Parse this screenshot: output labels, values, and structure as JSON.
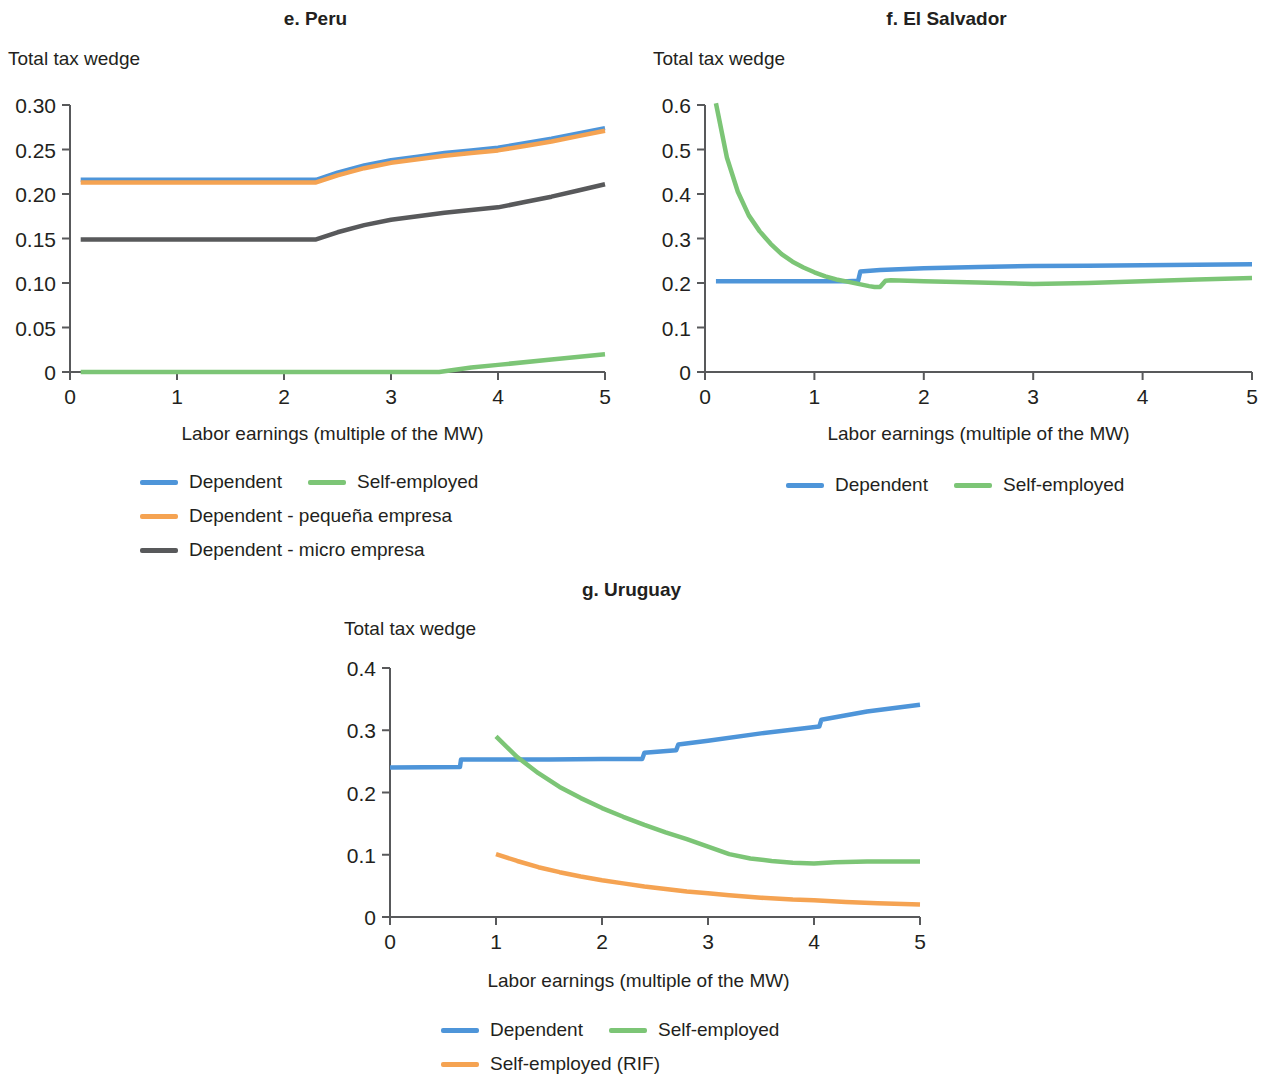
{
  "colors": {
    "dependent": "#4e95d9",
    "self_employed": "#7cc576",
    "dependent_pequena": "#f5a352",
    "dependent_micro": "#58595b",
    "self_employed_rif": "#f5a352",
    "axis": "#58595b",
    "text": "#231f20"
  },
  "panels": {
    "peru": {
      "title": "e. Peru",
      "y_axis_title": "Total tax wedge",
      "x_axis_title": "Labor earnings (multiple of the MW)",
      "legend": [
        [
          {
            "label": "Dependent",
            "color": "#4e95d9"
          },
          {
            "label": "Self-employed",
            "color": "#7cc576"
          }
        ],
        [
          {
            "label": "Dependent - pequeña empresa",
            "color": "#f5a352"
          }
        ],
        [
          {
            "label": "Dependent - micro empresa",
            "color": "#58595b"
          }
        ]
      ]
    },
    "el_salvador": {
      "title": "f. El Salvador",
      "y_axis_title": "Total tax wedge",
      "x_axis_title": "Labor earnings (multiple of the MW)",
      "legend": [
        [
          {
            "label": "Dependent",
            "color": "#4e95d9"
          },
          {
            "label": "Self-employed",
            "color": "#7cc576"
          }
        ]
      ]
    },
    "uruguay": {
      "title": "g. Uruguay",
      "y_axis_title": "Total tax wedge",
      "x_axis_title": "Labor earnings (multiple of the MW)",
      "legend": [
        [
          {
            "label": "Dependent",
            "color": "#4e95d9"
          },
          {
            "label": "Self-employed",
            "color": "#7cc576"
          }
        ],
        [
          {
            "label": "Self-employed (RIF)",
            "color": "#f5a352"
          }
        ]
      ]
    }
  },
  "chart_data": [
    {
      "id": "peru",
      "type": "line",
      "title": "e. Peru",
      "xlabel": "Labor earnings (multiple of the MW)",
      "ylabel": "Total tax wedge",
      "xlim": [
        0,
        5
      ],
      "ylim": [
        0,
        0.3
      ],
      "xticks": [
        "0",
        "1",
        "2",
        "3",
        "4",
        "5"
      ],
      "yticks": [
        "0",
        "0.05",
        "0.10",
        "0.15",
        "0.20",
        "0.25",
        "0.30"
      ],
      "grid": false,
      "legend_position": "below",
      "series": [
        {
          "name": "Dependent",
          "color": "#4e95d9",
          "x": [
            0.1,
            0.5,
            1.0,
            1.5,
            2.0,
            2.3,
            2.5,
            2.75,
            3.0,
            3.25,
            3.5,
            3.75,
            4.0,
            4.25,
            4.5,
            4.75,
            5.0
          ],
          "y": [
            0.216,
            0.216,
            0.216,
            0.216,
            0.216,
            0.216,
            0.224,
            0.232,
            0.238,
            0.242,
            0.246,
            0.249,
            0.252,
            0.257,
            0.262,
            0.268,
            0.274
          ]
        },
        {
          "name": "Dependent - pequeña empresa",
          "color": "#f5a352",
          "x": [
            0.1,
            0.5,
            1.0,
            1.5,
            2.0,
            2.3,
            2.5,
            2.75,
            3.0,
            3.25,
            3.5,
            3.75,
            4.0,
            4.25,
            4.5,
            4.75,
            5.0
          ],
          "y": [
            0.213,
            0.213,
            0.213,
            0.213,
            0.213,
            0.213,
            0.221,
            0.229,
            0.235,
            0.239,
            0.243,
            0.246,
            0.249,
            0.254,
            0.259,
            0.265,
            0.271
          ]
        },
        {
          "name": "Dependent - micro empresa",
          "color": "#58595b",
          "x": [
            0.1,
            0.5,
            1.0,
            1.5,
            2.0,
            2.3,
            2.5,
            2.75,
            3.0,
            3.25,
            3.5,
            3.75,
            4.0,
            4.25,
            4.5,
            4.75,
            5.0
          ],
          "y": [
            0.149,
            0.149,
            0.149,
            0.149,
            0.149,
            0.149,
            0.157,
            0.165,
            0.171,
            0.175,
            0.179,
            0.182,
            0.185,
            0.191,
            0.197,
            0.204,
            0.211
          ]
        },
        {
          "name": "Self-employed",
          "color": "#7cc576",
          "x": [
            0.1,
            1.0,
            2.0,
            3.0,
            3.45,
            3.75,
            4.0,
            4.5,
            5.0
          ],
          "y": [
            0.0,
            0.0,
            0.0,
            0.0,
            0.0,
            0.005,
            0.008,
            0.014,
            0.02
          ]
        }
      ]
    },
    {
      "id": "el_salvador",
      "type": "line",
      "title": "f. El Salvador",
      "xlabel": "Labor earnings (multiple of the MW)",
      "ylabel": "Total tax wedge",
      "xlim": [
        0,
        5
      ],
      "ylim": [
        0,
        0.6
      ],
      "xticks": [
        "0",
        "1",
        "2",
        "3",
        "4",
        "5"
      ],
      "yticks": [
        "0",
        "0.1",
        "0.2",
        "0.3",
        "0.4",
        "0.5",
        "0.6"
      ],
      "grid": false,
      "legend_position": "below",
      "series": [
        {
          "name": "Dependent",
          "color": "#4e95d9",
          "x": [
            0.1,
            0.5,
            1.0,
            1.3,
            1.4,
            1.42,
            1.6,
            2.0,
            2.5,
            3.0,
            3.5,
            4.0,
            4.5,
            5.0
          ],
          "y": [
            0.204,
            0.204,
            0.204,
            0.204,
            0.205,
            0.226,
            0.229,
            0.233,
            0.236,
            0.238,
            0.239,
            0.24,
            0.241,
            0.242
          ]
        },
        {
          "name": "Self-employed",
          "color": "#7cc576",
          "x": [
            0.1,
            0.2,
            0.3,
            0.4,
            0.5,
            0.6,
            0.7,
            0.8,
            0.9,
            1.0,
            1.1,
            1.2,
            1.3,
            1.4,
            1.5,
            1.55,
            1.6,
            1.65,
            1.7,
            2.0,
            2.5,
            3.0,
            3.5,
            4.0,
            4.5,
            5.0
          ],
          "y": [
            0.604,
            0.482,
            0.405,
            0.352,
            0.316,
            0.288,
            0.265,
            0.248,
            0.235,
            0.224,
            0.215,
            0.208,
            0.203,
            0.198,
            0.193,
            0.191,
            0.191,
            0.205,
            0.206,
            0.204,
            0.201,
            0.198,
            0.2,
            0.204,
            0.208,
            0.211
          ]
        }
      ]
    },
    {
      "id": "uruguay",
      "type": "line",
      "title": "g. Uruguay",
      "xlabel": "Labor earnings (multiple of the MW)",
      "ylabel": "Total tax wedge",
      "xlim": [
        0,
        5
      ],
      "ylim": [
        0,
        0.4
      ],
      "xticks": [
        "0",
        "1",
        "2",
        "3",
        "4",
        "5"
      ],
      "yticks": [
        "0",
        "0.1",
        "0.2",
        "0.3",
        "0.4"
      ],
      "grid": false,
      "legend_position": "below",
      "series": [
        {
          "name": "Dependent",
          "color": "#4e95d9",
          "x": [
            0.0,
            0.66,
            0.67,
            1.0,
            1.5,
            2.0,
            2.38,
            2.4,
            2.7,
            2.72,
            3.0,
            3.5,
            4.05,
            4.07,
            4.5,
            5.0
          ],
          "y": [
            0.24,
            0.241,
            0.253,
            0.253,
            0.253,
            0.254,
            0.254,
            0.264,
            0.268,
            0.277,
            0.283,
            0.295,
            0.306,
            0.317,
            0.33,
            0.341
          ]
        },
        {
          "name": "Self-employed",
          "color": "#7cc576",
          "x": [
            1.0,
            1.2,
            1.4,
            1.6,
            1.8,
            2.0,
            2.2,
            2.4,
            2.6,
            2.8,
            3.0,
            3.2,
            3.4,
            3.6,
            3.8,
            4.0,
            4.2,
            4.5,
            5.0
          ],
          "y": [
            0.29,
            0.257,
            0.231,
            0.209,
            0.191,
            0.175,
            0.161,
            0.148,
            0.136,
            0.125,
            0.113,
            0.101,
            0.094,
            0.09,
            0.087,
            0.086,
            0.088,
            0.089,
            0.089
          ]
        },
        {
          "name": "Self-employed (RIF)",
          "color": "#f5a352",
          "x": [
            1.0,
            1.2,
            1.4,
            1.6,
            1.8,
            2.0,
            2.2,
            2.4,
            2.6,
            2.8,
            3.0,
            3.2,
            3.5,
            3.8,
            4.0,
            4.3,
            4.6,
            5.0
          ],
          "y": [
            0.101,
            0.09,
            0.08,
            0.072,
            0.065,
            0.059,
            0.054,
            0.049,
            0.045,
            0.041,
            0.038,
            0.035,
            0.031,
            0.028,
            0.027,
            0.024,
            0.022,
            0.02
          ]
        }
      ]
    }
  ]
}
